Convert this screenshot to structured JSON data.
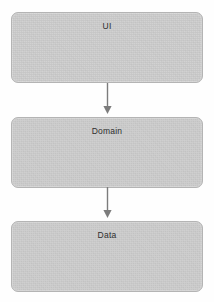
{
  "diagram": {
    "background_color": "#fefefe",
    "box_fill_color": "#cdcdcd",
    "box_border_color": "#b4b4b4",
    "arrow_color": "#7c7c7c",
    "label_color": "#2e2e2e",
    "layers": [
      {
        "id": "ui",
        "label": "UI"
      },
      {
        "id": "domain",
        "label": "Domain"
      },
      {
        "id": "data",
        "label": "Data"
      }
    ],
    "connectors": [
      {
        "id": "ui-domain",
        "from": "UI",
        "to": "Domain",
        "icon": "arrow-down-icon"
      },
      {
        "id": "domain-data",
        "from": "Domain",
        "to": "Data",
        "icon": "arrow-down-icon"
      }
    ]
  }
}
